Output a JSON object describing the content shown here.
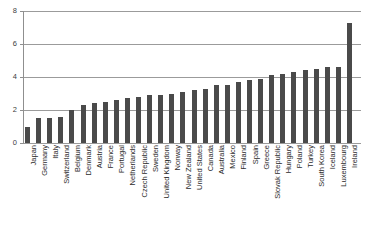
{
  "chart": {
    "title": "",
    "title_remnant": "",
    "ylabel": "",
    "xlabel": ""
  },
  "axis": {
    "y_ticks": [
      "0",
      "2",
      "4",
      "6",
      "8"
    ]
  },
  "chart_data": {
    "type": "bar",
    "title": "",
    "xlabel": "",
    "ylabel": "",
    "ylim": [
      0,
      8
    ],
    "yticks": [
      0,
      2,
      4,
      6,
      8
    ],
    "grid": true,
    "legend": false,
    "orientation": "vertical",
    "sorted": "ascending",
    "bar_color": "#4a4a4a",
    "categories": [
      "Japan",
      "Germany",
      "Italy",
      "Switzerland",
      "Belgium",
      "Denmark",
      "Austria",
      "France",
      "Portugal",
      "Netherlands",
      "Czech Republic",
      "Sweden",
      "United Kingdom",
      "Norway",
      "New Zealand",
      "United States",
      "Canada",
      "Australia",
      "Mexico",
      "Finland",
      "Spain",
      "Greece",
      "Slovak Republic",
      "Hungary",
      "Poland",
      "Turkey",
      "South Korea",
      "Iceland",
      "Luxembourg",
      "Ireland"
    ],
    "values": [
      1.0,
      1.5,
      1.5,
      1.6,
      2.0,
      2.3,
      2.4,
      2.5,
      2.6,
      2.7,
      2.8,
      2.9,
      2.9,
      3.0,
      3.1,
      3.2,
      3.3,
      3.5,
      3.5,
      3.7,
      3.8,
      3.9,
      4.1,
      4.2,
      4.3,
      4.4,
      4.5,
      4.6,
      4.6,
      7.3
    ]
  }
}
